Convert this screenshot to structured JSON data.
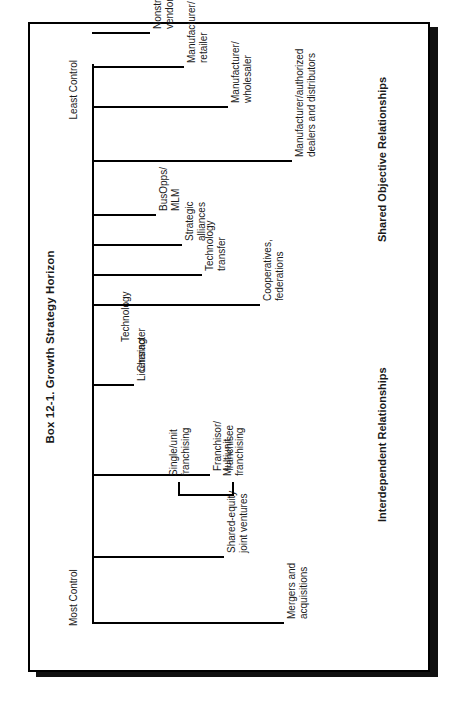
{
  "figure": {
    "title": "Box 12-1.  Growth Strategy Horizon",
    "axis_left_caption": "Most Control",
    "axis_right_caption": "Least Control",
    "section_left": "Interdependent Relationships",
    "section_right": "Shared Objective Relationships"
  },
  "chart_data": {
    "type": "diagram",
    "title": "Box 12-1.  Growth Strategy Horizon",
    "xlabel": "",
    "ylabel": "",
    "axis_labels": [
      "Most Control",
      "Least Control"
    ],
    "group_labels": [
      "Interdependent Relationships",
      "Shared Objective Relationships"
    ],
    "nodes": [
      {
        "label_line1": "Mergers and",
        "label_line2": "acquisitions",
        "x": 0,
        "depth": 178,
        "group": "Interdependent Relationships"
      },
      {
        "label_line1": "Shared-equity",
        "label_line2": "joint ventures",
        "x": 66,
        "depth": 118,
        "group": "Interdependent Relationships"
      },
      {
        "label_line1": "Franchisor/",
        "label_line2": "franchisee",
        "x": 148,
        "depth": 104,
        "group": "Interdependent Relationships"
      },
      {
        "label_line1": "Multiunit",
        "label_line2": "franchising",
        "x": 178,
        "depth": 0,
        "group": "Interdependent Relationships",
        "sub": true
      },
      {
        "label_line1": "Single/unit",
        "label_line2": "franchising",
        "x": 178,
        "depth": 0,
        "group": "Interdependent Relationships",
        "sub": true
      },
      {
        "label_line1": "Licensing",
        "label_line2": "",
        "x": 238,
        "depth": 28,
        "group": "Interdependent Relationships"
      },
      {
        "label_line1": "Character",
        "label_line2": "",
        "x": 262,
        "depth": 0,
        "group": "Interdependent Relationships",
        "sub": true
      },
      {
        "label_line1": "Technology",
        "label_line2": "",
        "x": 290,
        "depth": 0,
        "group": "Interdependent Relationships",
        "sub": true
      },
      {
        "label_line1": "Cooperatives,",
        "label_line2": "federations",
        "x": 318,
        "depth": 154,
        "group": "Shared Objective Relationships"
      },
      {
        "label_line1": "Technology",
        "label_line2": "transfer",
        "x": 348,
        "depth": 96,
        "group": "Shared Objective Relationships"
      },
      {
        "label_line1": "Strategic",
        "label_line2": "alliances",
        "x": 378,
        "depth": 76,
        "group": "Shared Objective Relationships"
      },
      {
        "label_line1": "BusOpps/",
        "label_line2": "MLM",
        "x": 408,
        "depth": 50,
        "group": "Shared Objective Relationships"
      },
      {
        "label_line1": "Manufacturer/authorized",
        "label_line2": "dealers and distributors",
        "x": 462,
        "depth": 186,
        "group": "Shared Objective Relationships"
      },
      {
        "label_line1": "Manufacturer/",
        "label_line2": "wholesaler",
        "x": 516,
        "depth": 122,
        "group": "Shared Objective Relationships"
      },
      {
        "label_line1": "Manufacturer/",
        "label_line2": "retailer",
        "x": 556,
        "depth": 78,
        "group": "Shared Objective Relationships"
      },
      {
        "label_line1": "Nonstrategic",
        "label_line2": "vendor/buyer",
        "x": 590,
        "depth": 44,
        "group": "Shared Objective Relationships"
      }
    ]
  }
}
